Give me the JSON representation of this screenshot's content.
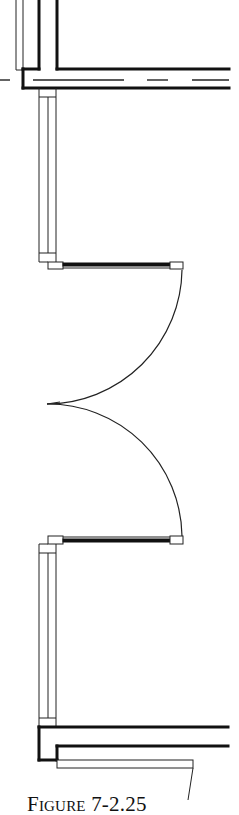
{
  "figure": {
    "caption": "Figure 7-2.25",
    "type": "architectural floor plan",
    "elements": [
      {
        "name": "upper-wall-corridor",
        "kind": "wall with centerline"
      },
      {
        "name": "upper-window",
        "kind": "window"
      },
      {
        "name": "double-door-leaf-top",
        "kind": "door with swing arc"
      },
      {
        "name": "double-door-leaf-bottom",
        "kind": "door with swing arc"
      },
      {
        "name": "lower-window",
        "kind": "window"
      },
      {
        "name": "lower-wall",
        "kind": "wall"
      },
      {
        "name": "sill",
        "kind": "threshold / sill with leader line"
      }
    ]
  },
  "colors": {
    "line": "#111111",
    "background": "#ffffff"
  }
}
